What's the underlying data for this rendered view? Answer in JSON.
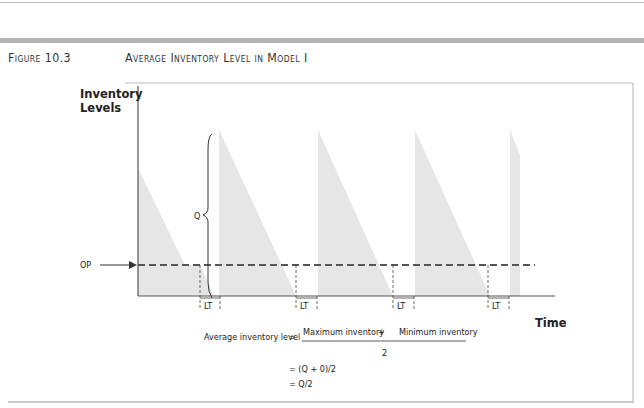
{
  "figure": {
    "number": "Figure 10.3",
    "title": "Average Inventory Level in Model I"
  },
  "diagram": {
    "y_axis_label_line1": "Inventory",
    "y_axis_label_line2": "Levels",
    "x_axis_label": "Time",
    "order_point_label": "OP",
    "order_quantity_label": "Q",
    "lead_time_label": "LT",
    "lead_time_markers": 5,
    "cycles": 5,
    "colors": {
      "fill": "#e6e6e6",
      "axis": "#555555",
      "dashed": "#555555"
    }
  },
  "formula": {
    "lhs": "Average inventory level",
    "equals": "=",
    "numerator_left": "Maximum inventory",
    "plus": "+",
    "numerator_right": "Minimum inventory",
    "denominator": "2",
    "step2": "= (Q + 0)/2",
    "step3": "= Q/2"
  }
}
